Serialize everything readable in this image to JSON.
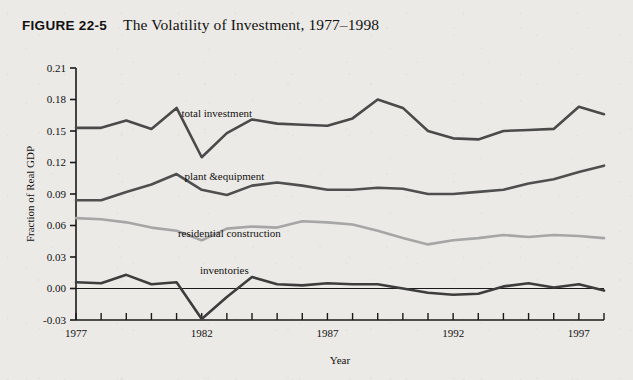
{
  "figure": {
    "number": "FIGURE 22-5",
    "title": "The Volatility of Investment, 1977–1998"
  },
  "colors": {
    "background": "#eceae6",
    "axis": "#1a1a1a",
    "total_investment": "#4a4a4a",
    "plant_equipment": "#4f4f4f",
    "residential_construction": "#a6a6a6",
    "inventories": "#3d3d3d"
  },
  "chart_data": {
    "type": "line",
    "title": "The Volatility of Investment, 1977–1998",
    "xlabel": "Year",
    "ylabel": "Fraction of Real GDP",
    "xlim": [
      1977,
      1998
    ],
    "ylim": [
      -0.03,
      0.21
    ],
    "ytick_step": 0.03,
    "yticks": [
      "0.21",
      "0.18",
      "0.15",
      "0.12",
      "0.09",
      "0.06",
      "0.03",
      "0.00",
      "-0.03"
    ],
    "ytick_values": [
      0.21,
      0.18,
      0.15,
      0.12,
      0.09,
      0.06,
      0.03,
      0.0,
      -0.03
    ],
    "x": [
      1977,
      1978,
      1979,
      1980,
      1981,
      1982,
      1983,
      1984,
      1985,
      1986,
      1987,
      1988,
      1989,
      1990,
      1991,
      1992,
      1993,
      1994,
      1995,
      1996,
      1997,
      1998
    ],
    "xticks_labeled": [
      "1977",
      "1982",
      "1987",
      "1992",
      "1997"
    ],
    "xtick_label_values": [
      1977,
      1982,
      1987,
      1992,
      1997
    ],
    "grid": false,
    "legend": "inline-labels",
    "zero_line": true,
    "series": [
      {
        "name": "total investment",
        "color": "#4a4a4a",
        "label_x": 1982.6,
        "label_y": 0.163,
        "values": [
          0.153,
          0.153,
          0.16,
          0.152,
          0.172,
          0.125,
          0.148,
          0.161,
          0.157,
          0.156,
          0.155,
          0.162,
          0.18,
          0.172,
          0.15,
          0.143,
          0.142,
          0.15,
          0.151,
          0.152,
          0.173,
          0.166
        ]
      },
      {
        "name": "plant &equipment",
        "color": "#4f4f4f",
        "label_x": 1982.9,
        "label_y": 0.103,
        "values": [
          0.084,
          0.084,
          0.092,
          0.099,
          0.109,
          0.094,
          0.089,
          0.098,
          0.101,
          0.098,
          0.094,
          0.094,
          0.096,
          0.095,
          0.09,
          0.09,
          0.092,
          0.094,
          0.1,
          0.104,
          0.111,
          0.117
        ]
      },
      {
        "name": "residential construction",
        "color": "#a6a6a6",
        "label_x": 1983.1,
        "label_y": 0.049,
        "values": [
          0.067,
          0.066,
          0.063,
          0.058,
          0.055,
          0.046,
          0.057,
          0.059,
          0.058,
          0.064,
          0.063,
          0.061,
          0.055,
          0.048,
          0.042,
          0.046,
          0.048,
          0.051,
          0.049,
          0.051,
          0.05,
          0.048
        ]
      },
      {
        "name": "inventories",
        "color": "#3d3d3d",
        "label_x": 1982.9,
        "label_y": 0.014,
        "values": [
          0.006,
          0.005,
          0.013,
          0.004,
          0.006,
          -0.029,
          -0.008,
          0.011,
          0.004,
          0.003,
          0.005,
          0.004,
          0.004,
          0.0,
          -0.004,
          -0.006,
          -0.005,
          0.002,
          0.005,
          0.001,
          0.004,
          -0.002
        ]
      }
    ]
  }
}
